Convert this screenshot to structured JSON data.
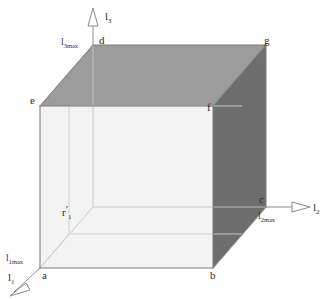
{
  "figure": {
    "background_color": "#ffffff",
    "line_color": "#8a8a8a",
    "dark_line_color": "#6e6e6e",
    "text_color": "#2b2b2b",
    "faces": {
      "front_fill": "#f2f2f2",
      "top_fill": "#9b9b9b",
      "right_fill": "#6b6b6b",
      "hidden_fill": "#fbfbfb"
    }
  },
  "axes": [
    {
      "id": "l1",
      "label": "l",
      "subscript": "1",
      "max_label": "l",
      "max_subscript": "1max",
      "direction": "down-left",
      "origin_vertex": "a"
    },
    {
      "id": "l2",
      "label": "l",
      "subscript": "2",
      "max_label": "l",
      "max_subscript": "2max",
      "direction": "right",
      "origin_vertex": "c"
    },
    {
      "id": "l3",
      "label": "l",
      "subscript": "3",
      "max_label": "l",
      "max_subscript": "3max",
      "direction": "up",
      "origin_vertex": "d"
    }
  ],
  "vertices": [
    {
      "id": "a",
      "label": "a",
      "x": 40,
      "y": 268
    },
    {
      "id": "b",
      "label": "b",
      "x": 213,
      "y": 268
    },
    {
      "id": "c",
      "label": "c",
      "x": 266,
      "y": 207
    },
    {
      "id": "d",
      "label": "d",
      "x": 93,
      "y": 45
    },
    {
      "id": "e",
      "label": "e",
      "x": 40,
      "y": 106
    },
    {
      "id": "f",
      "label": "f",
      "x": 213,
      "y": 106
    },
    {
      "id": "g",
      "label": "g",
      "x": 266,
      "y": 45
    }
  ],
  "interior_label": {
    "base": "r",
    "prime": "′",
    "subscript": "1"
  },
  "axis_labels": {
    "l1": "l",
    "l1_sub": "1",
    "l2": "l",
    "l2_sub": "2",
    "l3": "l",
    "l3_sub": "3",
    "l1max": "l",
    "l1max_sub": "1max",
    "l2max": "l",
    "l2max_sub": "2max",
    "l3max": "l",
    "l3max_sub": "3max"
  },
  "vertex_labels": {
    "a": "a",
    "b": "b",
    "c": "c",
    "d": "d",
    "e": "e",
    "f": "f",
    "g": "g"
  }
}
